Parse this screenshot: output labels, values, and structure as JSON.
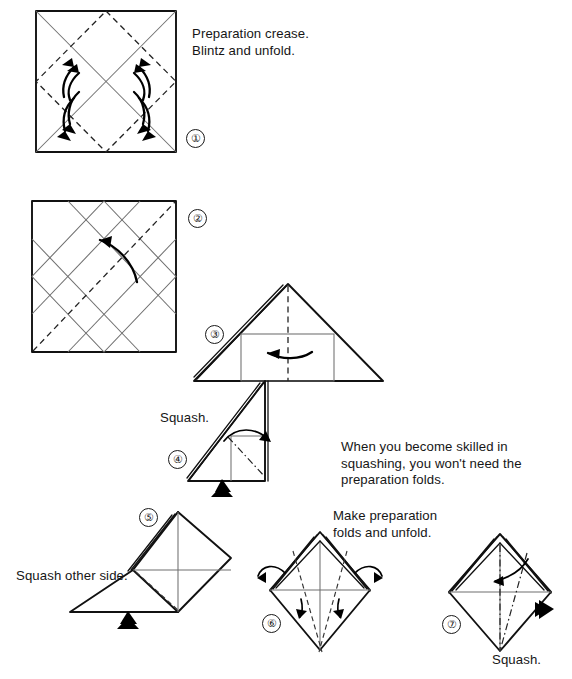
{
  "page": {
    "background_color": "#ffffff",
    "ink_color": "#111111"
  },
  "captions": [
    {
      "id": "cap-step1",
      "text": "Preparation crease.\nBlintz and unfold.",
      "x": 192,
      "y": 26
    },
    {
      "id": "cap-step4",
      "text": "Squash.",
      "x": 160,
      "y": 410
    },
    {
      "id": "cap-note",
      "text": "When you become skilled in\nsquashing, you won't need the\npreparation folds.",
      "x": 341,
      "y": 439
    },
    {
      "id": "cap-step5",
      "text": "Squash other side.",
      "x": 16,
      "y": 568
    },
    {
      "id": "cap-step6",
      "text": "Make preparation\nfolds and unfold.",
      "x": 333,
      "y": 508
    },
    {
      "id": "cap-step7",
      "text": "Squash.",
      "x": 492,
      "y": 652
    }
  ],
  "steps": [
    {
      "number": "①",
      "label": "step-1",
      "x": 186,
      "y": 129,
      "description": "Square with blintz diamond creases and four folding arrows"
    },
    {
      "number": "②",
      "label": "step-2",
      "x": 188,
      "y": 209,
      "description": "Square with full crease grid and one diagonal valley fold"
    },
    {
      "number": "③",
      "label": "step-3",
      "x": 205,
      "y": 325,
      "description": "Large triangle with vertical center fold and inner rectangle"
    },
    {
      "number": "④",
      "label": "step-4",
      "x": 168,
      "y": 450,
      "description": "Right triangle squash with push arrow"
    },
    {
      "number": "⑤",
      "label": "step-5",
      "x": 139,
      "y": 508,
      "description": "Squash other side, diamond with flap"
    },
    {
      "number": "⑥",
      "label": "step-6",
      "x": 262,
      "y": 614,
      "description": "Diamond with preparation folds and four arrows"
    },
    {
      "number": "⑦",
      "label": "step-7",
      "x": 442,
      "y": 615,
      "description": "Diamond with squash arrows"
    }
  ],
  "icons": {
    "push_arrow": "solid-arrowhead-icon",
    "fold_arrow": "curved-fold-arrow-icon"
  }
}
